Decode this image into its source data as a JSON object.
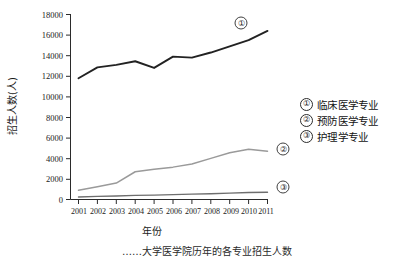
{
  "chart_data": {
    "type": "line",
    "title": "",
    "xlabel": "年份",
    "ylabel": "招生人数(人)",
    "x": [
      "2001",
      "2002",
      "2003",
      "2004",
      "2005",
      "2006",
      "2007",
      "2008",
      "2009",
      "2010",
      "2011"
    ],
    "categories": [
      "2001",
      "2002",
      "2003",
      "2004",
      "2005",
      "2006",
      "2007",
      "2008",
      "2009",
      "2010",
      "2011"
    ],
    "ylim": [
      0,
      18000
    ],
    "yticks": [
      "0",
      "2000",
      "4000",
      "6000",
      "8000",
      "10000",
      "12000",
      "14000",
      "16000",
      "18000"
    ],
    "ytick_values": [
      0,
      2000,
      4000,
      6000,
      8000,
      10000,
      12000,
      14000,
      16000,
      18000
    ],
    "grid": false,
    "legend_position": "right",
    "series": [
      {
        "name": "临床医学专业",
        "marker": "①",
        "color": "#222222",
        "values": [
          11800,
          12850,
          13100,
          13450,
          12800,
          13900,
          13800,
          14300,
          14900,
          15500,
          16400
        ]
      },
      {
        "name": "预防医学专业",
        "marker": "②",
        "color": "#9a9a9a",
        "values": [
          900,
          1250,
          1600,
          2700,
          2950,
          3150,
          3450,
          4000,
          4550,
          4900,
          4700
        ]
      },
      {
        "name": "护理学专业",
        "marker": "③",
        "color": "#6e6e6e",
        "values": [
          250,
          300,
          340,
          400,
          430,
          470,
          520,
          560,
          620,
          680,
          700
        ]
      }
    ],
    "data_markers": [
      {
        "label": "①",
        "series": "临床医学专业"
      },
      {
        "label": "②",
        "series": "预防医学专业"
      },
      {
        "label": "③",
        "series": "护理学专业"
      }
    ]
  },
  "axes": {
    "y_title": "招生人数(人)",
    "x_title": "年份",
    "y_tick_labels": [
      "18000",
      "16000",
      "14000",
      "12000",
      "10000",
      "8000",
      "6000",
      "4000",
      "2000",
      "0"
    ],
    "x_tick_labels": [
      "2001",
      "2002",
      "2003",
      "2004",
      "2005",
      "2006",
      "2007",
      "2008",
      "2009",
      "2010",
      "2011"
    ]
  },
  "legend": {
    "items": [
      {
        "marker": "①",
        "label": "临床医学专业"
      },
      {
        "marker": "②",
        "label": "预防医学专业"
      },
      {
        "marker": "③",
        "label": "护理学专业"
      }
    ]
  },
  "caption": {
    "text": "……大学医学院历年的各专业招生人数"
  }
}
